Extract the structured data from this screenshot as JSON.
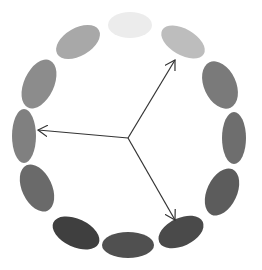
{
  "diagram": {
    "type": "color-wheel-ring",
    "center": {
      "x": 128,
      "y": 138
    },
    "ellipses": [
      {
        "cx": 130,
        "cy": 25,
        "rx": 22,
        "ry": 13,
        "rot": 0,
        "fill": "#ececec"
      },
      {
        "cx": 183,
        "cy": 42,
        "rx": 24,
        "ry": 13,
        "rot": 30,
        "fill": "#bdbdbd"
      },
      {
        "cx": 220,
        "cy": 85,
        "rx": 16,
        "ry": 25,
        "rot": -25,
        "fill": "#7a7a7a"
      },
      {
        "cx": 234,
        "cy": 138,
        "rx": 12,
        "ry": 26,
        "rot": 0,
        "fill": "#6e6e6e"
      },
      {
        "cx": 222,
        "cy": 192,
        "rx": 15,
        "ry": 25,
        "rot": 25,
        "fill": "#5c5c5c"
      },
      {
        "cx": 181,
        "cy": 232,
        "rx": 24,
        "ry": 14,
        "rot": -25,
        "fill": "#4a4a4a"
      },
      {
        "cx": 128,
        "cy": 245,
        "rx": 26,
        "ry": 13,
        "rot": 0,
        "fill": "#505050"
      },
      {
        "cx": 76,
        "cy": 233,
        "rx": 25,
        "ry": 14,
        "rot": 25,
        "fill": "#3f3f3f"
      },
      {
        "cx": 37,
        "cy": 188,
        "rx": 15,
        "ry": 25,
        "rot": -25,
        "fill": "#6a6a6a"
      },
      {
        "cx": 24,
        "cy": 136,
        "rx": 12,
        "ry": 27,
        "rot": 0,
        "fill": "#808080"
      },
      {
        "cx": 39,
        "cy": 84,
        "rx": 15,
        "ry": 26,
        "rot": 25,
        "fill": "#8c8c8c"
      },
      {
        "cx": 78,
        "cy": 42,
        "rx": 24,
        "ry": 14,
        "rot": -30,
        "fill": "#a8a8a8"
      }
    ],
    "arrows": [
      {
        "name": "arrow-upper-right",
        "x2": 175,
        "y2": 60
      },
      {
        "name": "arrow-left",
        "x2": 38,
        "y2": 130
      },
      {
        "name": "arrow-lower-right",
        "x2": 175,
        "y2": 220
      }
    ],
    "stroke_color": "#333333"
  }
}
